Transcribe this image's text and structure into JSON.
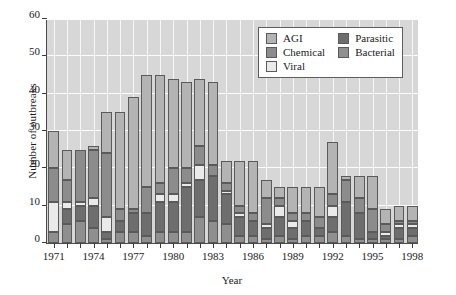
{
  "chart_data": {
    "type": "bar",
    "stacked": true,
    "title": "",
    "xlabel": "Year",
    "ylabel": "Number of outbreaks",
    "ylim": [
      0,
      60
    ],
    "yticks": [
      0,
      10,
      20,
      30,
      40,
      50,
      60
    ],
    "grid": "both-white-on-gray",
    "legend_position": "top-right",
    "categories": [
      "1971",
      "1972",
      "1973",
      "1974",
      "1975",
      "1976",
      "1977",
      "1978",
      "1979",
      "1980",
      "1981",
      "1982",
      "1983",
      "1984",
      "1985",
      "1986",
      "1987",
      "1988",
      "1989",
      "1990",
      "1991",
      "1992",
      "1993",
      "1994",
      "1995",
      "1996",
      "1997",
      "1998"
    ],
    "xtick_labels": [
      "1971",
      "1974",
      "1977",
      "1980",
      "1983",
      "1986",
      "1989",
      "1992",
      "1995",
      "1998"
    ],
    "series": [
      {
        "name": "Bacterial",
        "color": "#8f8f8f",
        "values": [
          3,
          5,
          6,
          4,
          1,
          3,
          3,
          2,
          3,
          3,
          3,
          7,
          6,
          5,
          2,
          2,
          1,
          2,
          1,
          2,
          2,
          3,
          2,
          1,
          1,
          1,
          1,
          2
        ]
      },
      {
        "name": "Parasitic",
        "color": "#6e6e6e",
        "values": [
          0,
          4,
          4,
          6,
          2,
          3,
          5,
          6,
          8,
          8,
          12,
          10,
          12,
          8,
          5,
          4,
          3,
          5,
          3,
          4,
          2,
          4,
          9,
          7,
          2,
          1,
          3,
          2
        ]
      },
      {
        "name": "Viral",
        "color": "#eaeaea",
        "values": [
          8,
          2,
          1,
          2,
          4,
          0,
          0,
          0,
          2,
          2,
          1,
          4,
          0,
          1,
          1,
          0,
          1,
          3,
          2,
          0,
          0,
          3,
          0,
          0,
          0,
          1,
          1,
          1
        ]
      },
      {
        "name": "Chemical",
        "color": "#8c8c8c",
        "values": [
          9,
          6,
          14,
          13,
          17,
          3,
          1,
          7,
          3,
          7,
          4,
          5,
          3,
          2,
          2,
          2,
          7,
          2,
          2,
          2,
          3,
          3,
          6,
          4,
          6,
          2,
          1,
          1
        ]
      },
      {
        "name": "AGI",
        "color": "#b4b4b4",
        "values": [
          10,
          8,
          0,
          1,
          11,
          26,
          30,
          30,
          29,
          24,
          23,
          18,
          22,
          6,
          12,
          14,
          5,
          3,
          7,
          7,
          8,
          14,
          1,
          6,
          9,
          4,
          4,
          4
        ]
      }
    ],
    "totals": [
      30,
      25,
      25,
      26,
      35,
      35,
      39,
      45,
      45,
      44,
      43,
      44,
      43,
      22,
      22,
      22,
      17,
      15,
      15,
      15,
      15,
      27,
      18,
      18,
      18,
      9,
      10,
      10
    ]
  },
  "legend": {
    "items": [
      {
        "label": "AGI",
        "color": "#b4b4b4"
      },
      {
        "label": "Parasitic",
        "color": "#6e6e6e"
      },
      {
        "label": "Chemical",
        "color": "#8c8c8c"
      },
      {
        "label": "Bacterial",
        "color": "#8f8f8f"
      },
      {
        "label": "Viral",
        "color": "#eaeaea"
      }
    ]
  }
}
